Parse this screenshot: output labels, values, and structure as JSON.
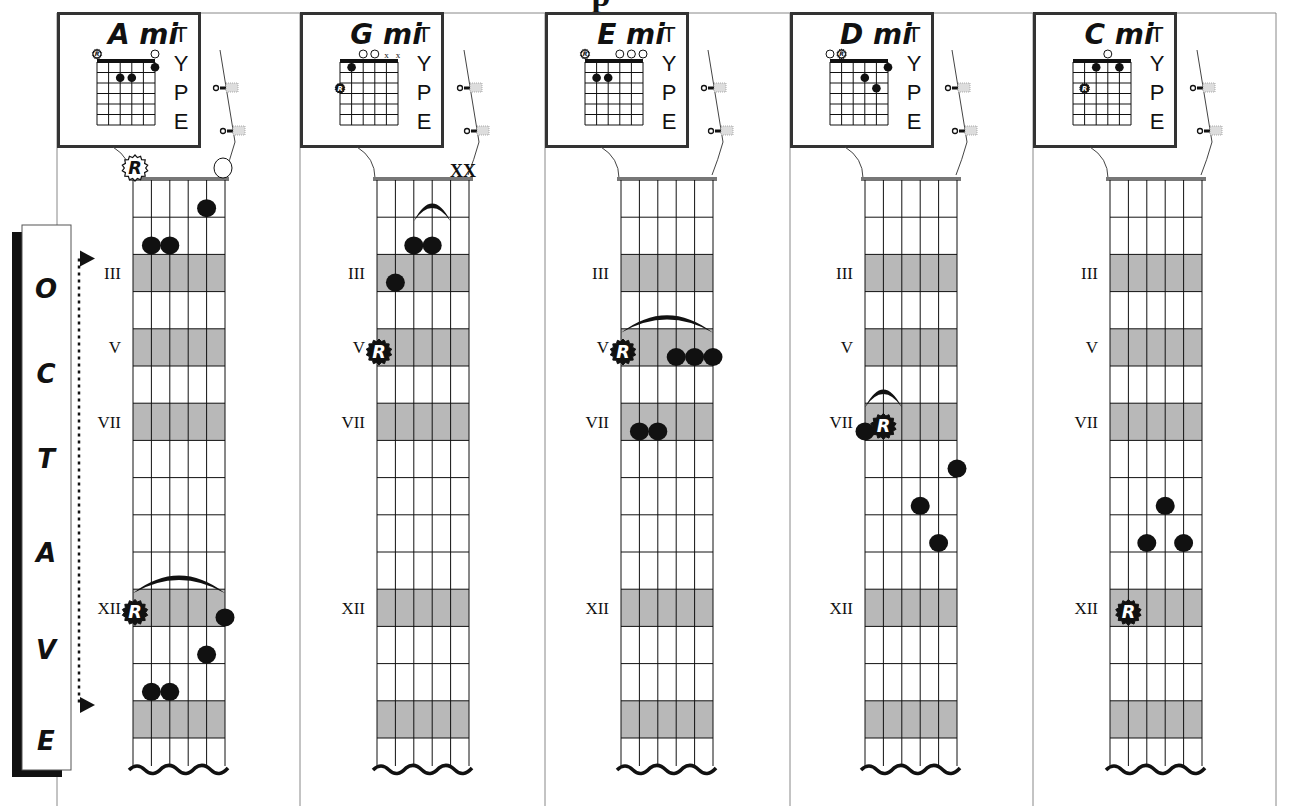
{
  "page": {
    "title_fragment": "p",
    "colors": {
      "ink": "#111111",
      "shade": "#b8b8b8",
      "panel_border": "#333333",
      "frame": "#888888"
    }
  },
  "octave_label": {
    "letters": [
      "O",
      "C",
      "T",
      "A",
      "V",
      "E"
    ],
    "arrow_top_fret": 3,
    "arrow_bottom_fret": 15
  },
  "fretboard": {
    "shaded_frets": [
      3,
      5,
      7,
      12,
      15
    ],
    "fret_markers": [
      {
        "fret": 3,
        "label": "III"
      },
      {
        "fret": 5,
        "label": "V"
      },
      {
        "fret": 7,
        "label": "VII"
      },
      {
        "fret": 12,
        "label": "XII"
      }
    ],
    "num_frets": 15
  },
  "type_label": [
    "T",
    "Y",
    "P",
    "E"
  ],
  "panels": [
    {
      "name": "A mi",
      "chord_box": {
        "root_open": [
          5
        ],
        "open": [
          0
        ],
        "muted": [],
        "dots": [
          {
            "s": 0,
            "f": 1
          },
          {
            "s": 2,
            "f": 2
          },
          {
            "s": 3,
            "f": 2
          }
        ],
        "roots": []
      },
      "nut_marks": {
        "root_open_string": 5,
        "open_strings": [
          0
        ],
        "muted": []
      },
      "notes": [
        {
          "s": 1,
          "f": 1
        },
        {
          "s": 3,
          "f": 2
        },
        {
          "s": 4,
          "f": 2
        },
        {
          "s": 5,
          "f": 12,
          "root": true
        },
        {
          "s": 0,
          "f": 12
        },
        {
          "s": 1,
          "f": 13
        },
        {
          "s": 3,
          "f": 14
        },
        {
          "s": 4,
          "f": 14
        }
      ],
      "barres": [
        {
          "fret": 12,
          "from": 5,
          "to": 0
        }
      ]
    },
    {
      "name": "G mi",
      "chord_box": {
        "root_open": [],
        "open": [
          2,
          3
        ],
        "muted": [
          0,
          1
        ],
        "dots": [
          {
            "s": 4,
            "f": 1
          }
        ],
        "roots": [
          {
            "s": 5,
            "f": 3
          }
        ]
      },
      "nut_marks": {
        "root_open_string": null,
        "open_strings": [],
        "muted": [
          0,
          1
        ],
        "muted_label": "XX"
      },
      "notes": [
        {
          "s": 3,
          "f": 2
        },
        {
          "s": 2,
          "f": 2
        },
        {
          "s": 4,
          "f": 3
        },
        {
          "s": 5,
          "f": 5,
          "root": true
        }
      ],
      "barres": [
        {
          "fret": 2,
          "from": 3,
          "to": 1
        }
      ]
    },
    {
      "name": "E mi",
      "chord_box": {
        "root_open": [
          5
        ],
        "open": [
          0,
          1,
          2
        ],
        "muted": [],
        "dots": [
          {
            "s": 4,
            "f": 2
          },
          {
            "s": 3,
            "f": 2
          }
        ],
        "roots": []
      },
      "nut_marks": {
        "root_open_string": null,
        "open_strings": [],
        "muted": []
      },
      "notes": [
        {
          "s": 5,
          "f": 5,
          "root": true
        },
        {
          "s": 2,
          "f": 5
        },
        {
          "s": 1,
          "f": 5
        },
        {
          "s": 0,
          "f": 5
        },
        {
          "s": 4,
          "f": 7
        },
        {
          "s": 3,
          "f": 7
        }
      ],
      "barres": [
        {
          "fret": 5,
          "from": 5,
          "to": 0
        }
      ]
    },
    {
      "name": "D mi",
      "chord_box": {
        "root_open": [
          4
        ],
        "open": [
          5
        ],
        "muted": [],
        "dots": [
          {
            "s": 0,
            "f": 1
          },
          {
            "s": 2,
            "f": 2
          },
          {
            "s": 1,
            "f": 3
          }
        ],
        "roots": []
      },
      "nut_marks": {
        "root_open_string": null,
        "open_strings": [],
        "muted": []
      },
      "notes": [
        {
          "s": 5,
          "f": 7
        },
        {
          "s": 4,
          "f": 7,
          "root": true
        },
        {
          "s": 0,
          "f": 8
        },
        {
          "s": 2,
          "f": 9
        },
        {
          "s": 1,
          "f": 10
        }
      ],
      "barres": [
        {
          "fret": 7,
          "from": 5,
          "to": 3
        }
      ]
    },
    {
      "name": "C mi",
      "chord_box": {
        "root_open": [],
        "open": [
          2
        ],
        "muted": [],
        "dots": [
          {
            "s": 3,
            "f": 1
          },
          {
            "s": 1,
            "f": 1
          }
        ],
        "roots": [
          {
            "s": 4,
            "f": 3
          }
        ]
      },
      "nut_marks": {
        "root_open_string": null,
        "open_strings": [],
        "muted": []
      },
      "notes": [
        {
          "s": 2,
          "f": 9
        },
        {
          "s": 3,
          "f": 10
        },
        {
          "s": 1,
          "f": 10
        },
        {
          "s": 4,
          "f": 12,
          "root": true
        }
      ],
      "barres": []
    }
  ]
}
